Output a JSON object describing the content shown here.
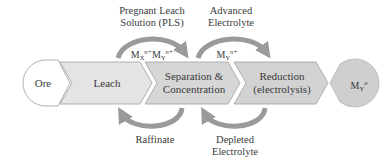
{
  "colors": {
    "ore_fill": "#ffffff",
    "leach_fill": "#e4e4e4",
    "stage_fill": "#d4d4d4",
    "product_fill": "#cfcfcf",
    "outline": "#a8a8a8",
    "arrow": "#9a9a9a",
    "text": "#3a3a3a"
  },
  "nodes": {
    "ore": {
      "label": "Ore"
    },
    "leach": {
      "label": "Leach"
    },
    "separation": {
      "line1": "Separation &",
      "line2": "Concentration"
    },
    "reduction": {
      "line1": "Reduction",
      "line2": "(electrolysis)"
    },
    "product": {
      "base": "M",
      "sub": "Y",
      "sup": "o"
    }
  },
  "flows": {
    "pls": {
      "title_line1": "Pregnant Leach",
      "title_line2": "Solution (PLS)",
      "species": [
        {
          "base": "M",
          "sub": "X",
          "sup": "n+"
        },
        {
          "base": "M",
          "sub": "Y",
          "sup": "n+"
        }
      ]
    },
    "advanced": {
      "title_line1": "Advanced",
      "title_line2": "Electrolyte",
      "species": [
        {
          "base": "M",
          "sub": "Y",
          "sup": "n+"
        }
      ]
    },
    "raffinate": {
      "title": "Raffinate"
    },
    "depleted": {
      "title_line1": "Depleted",
      "title_line2": "Electrolyte"
    }
  }
}
